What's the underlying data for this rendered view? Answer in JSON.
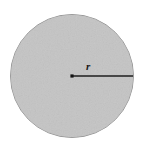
{
  "figure": {
    "name": "circle-with-radius-diagram",
    "canvas": {
      "width": 142,
      "height": 147
    },
    "background_color": "#ffffff",
    "circle": {
      "center_x": 72,
      "center_y": 76,
      "radius": 61.5,
      "fill_color": "#c4c4c4",
      "stroke_color": "#9a9a9a",
      "stroke_width": 1
    },
    "center_point": {
      "x": 72,
      "y": 76,
      "color": "#141414",
      "size": 3.2
    },
    "radius_segment": {
      "x1": 72,
      "y1": 76,
      "x2": 133,
      "y2": 76,
      "color": "#1e1e1e",
      "width": 1.6
    },
    "radius_label": {
      "text": "r",
      "x": 86,
      "y": 70,
      "color": "#1a1a1a"
    }
  }
}
